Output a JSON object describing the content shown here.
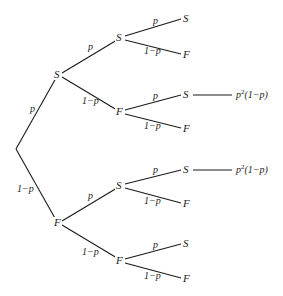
{
  "diagram": {
    "type": "probability-tree",
    "branch_labels": {
      "success": "p",
      "failure": "1−p"
    },
    "nodes": {
      "l1_s": "S",
      "l1_f": "F",
      "l2_ss": "S",
      "l2_sf": "F",
      "l2_fs": "S",
      "l2_ff": "F",
      "l3_sss": "S",
      "l3_ssf": "F",
      "l3_sfs": "S",
      "l3_sff": "F",
      "l3_fss": "S",
      "l3_fsf": "F",
      "l3_ffs": "S",
      "l3_fff": "F"
    },
    "outcomes": {
      "sfs": {
        "base": "p",
        "exp": "2",
        "rest": "(1−p)"
      },
      "fss": {
        "base": "p",
        "exp": "2",
        "rest": "(1−p)"
      }
    }
  }
}
